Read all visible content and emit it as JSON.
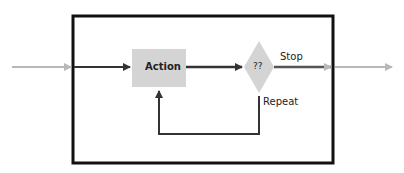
{
  "diagram": {
    "type": "loop-flowchart",
    "nodes": [
      {
        "id": "action",
        "shape": "rectangle",
        "label": "Action"
      },
      {
        "id": "decision",
        "shape": "diamond",
        "label": "??"
      }
    ],
    "edges": [
      {
        "from": "input",
        "to": "action",
        "label": ""
      },
      {
        "from": "action",
        "to": "decision",
        "label": ""
      },
      {
        "from": "decision",
        "to": "output",
        "label": "Stop"
      },
      {
        "from": "decision",
        "to": "action",
        "label": "Repeat"
      }
    ],
    "labels": {
      "action": "Action",
      "decision": "??",
      "stop": "Stop",
      "repeat": "Repeat"
    },
    "colors": {
      "frame": "#111111",
      "node_fill": "#d4d4d4",
      "arrow_dark": "#333333",
      "arrow_light": "#b8b8b8"
    }
  }
}
